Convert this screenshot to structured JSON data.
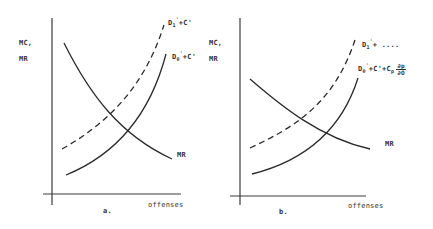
{
  "figure": {
    "panels": [
      {
        "id": "a",
        "caption": "a.",
        "y_axis_label_line1": "MC,",
        "y_axis_label_line2": "MR",
        "x_axis_label": "offenses",
        "curves": {
          "mr": {
            "label": "MR",
            "style": "solid",
            "shape": "decreasing-convex"
          },
          "dashed": {
            "label_base": "D",
            "label_sub": "1",
            "label_sup": "'",
            "label_rest": "+C'",
            "style": "dashed",
            "shape": "increasing-convex"
          },
          "solid": {
            "label_base": "D",
            "label_sub": "0",
            "label_sup": "'",
            "label_rest": "+C'",
            "style": "solid",
            "shape": "increasing-convex"
          }
        }
      },
      {
        "id": "b",
        "caption": "b.",
        "y_axis_label_line1": "MC,",
        "y_axis_label_line2": "MR",
        "x_axis_label": "offenses",
        "curves": {
          "mr": {
            "label": "MR",
            "style": "solid",
            "shape": "decreasing-convex"
          },
          "dashed": {
            "label_base": "D",
            "label_sub": "1",
            "label_sup": "'",
            "label_rest": "+ ....",
            "style": "dashed",
            "shape": "increasing-convex"
          },
          "solid": {
            "label_base": "D",
            "label_sub": "0",
            "label_sup": "'",
            "label_rest": "+C'+C",
            "label_sub2": "p",
            "frac_num": "∂p",
            "frac_den": "∂O",
            "style": "solid",
            "shape": "increasing-convex"
          }
        }
      }
    ],
    "colors": {
      "ink": "#2a2a2a",
      "background": "#ffffff"
    }
  }
}
